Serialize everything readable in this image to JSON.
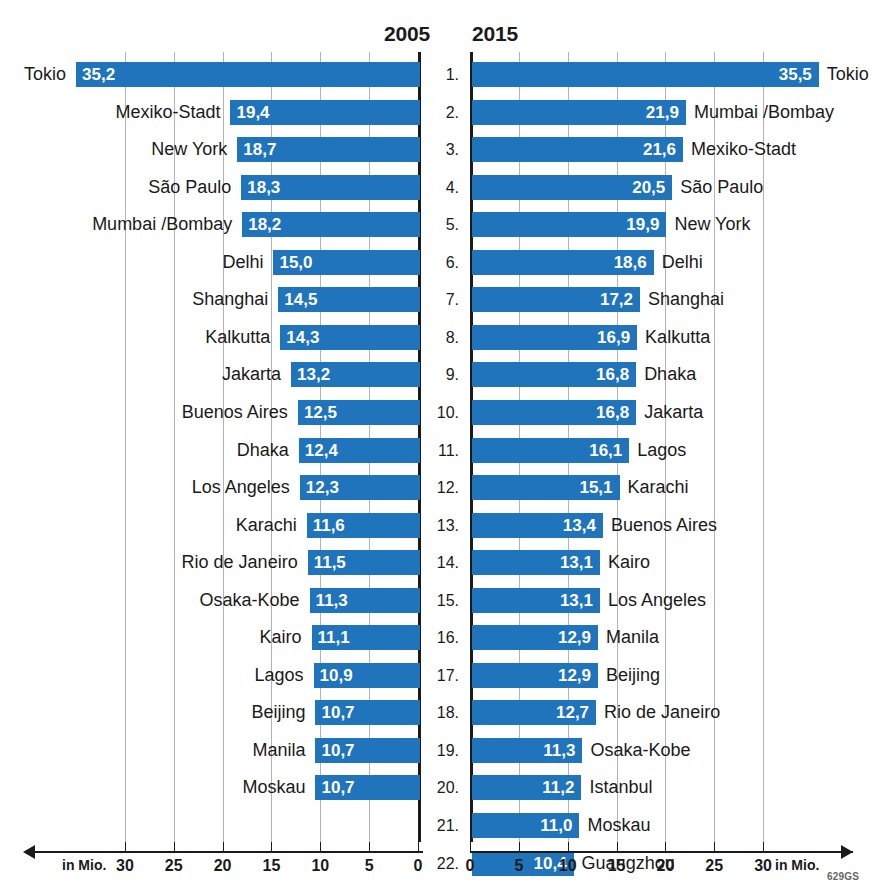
{
  "chart_data": {
    "type": "bar",
    "title": "",
    "xlabel": "in Mio.",
    "ylabel": "",
    "orientation": "horizontal",
    "grid": true,
    "panels": [
      {
        "name": "2005",
        "year_label": "2005",
        "direction": "rtl",
        "axis_unit": "in Mio.",
        "xlim": [
          0,
          35.2
        ],
        "ticks": [
          30,
          25,
          20,
          15,
          10,
          5,
          0
        ],
        "tick_labels": [
          "30",
          "25",
          "20",
          "15",
          "10",
          "5",
          "0"
        ],
        "categories": [
          "Tokio",
          "Mexiko-Stadt",
          "New York",
          "São Paulo",
          "Mumbai /Bombay",
          "Delhi",
          "Shanghai",
          "Kalkutta",
          "Jakarta",
          "Buenos Aires",
          "Dhaka",
          "Los Angeles",
          "Karachi",
          "Rio de Janeiro",
          "Osaka-Kobe",
          "Kairo",
          "Lagos",
          "Beijing",
          "Manila",
          "Moskau"
        ],
        "values": [
          35.2,
          19.4,
          18.7,
          18.3,
          18.2,
          15.0,
          14.5,
          14.3,
          13.2,
          12.5,
          12.4,
          12.3,
          11.6,
          11.5,
          11.3,
          11.1,
          10.9,
          10.7,
          10.7,
          10.7
        ],
        "value_labels": [
          "35,2",
          "19,4",
          "18,7",
          "18,3",
          "18,2",
          "15,0",
          "14,5",
          "14,3",
          "13,2",
          "12,5",
          "12,4",
          "12,3",
          "11,6",
          "11,5",
          "11,3",
          "11,1",
          "10,9",
          "10,7",
          "10,7",
          "10,7"
        ]
      },
      {
        "name": "2015",
        "year_label": "2015",
        "direction": "ltr",
        "axis_unit": "in Mio.",
        "xlim": [
          0,
          35.5
        ],
        "ticks": [
          0,
          5,
          10,
          15,
          20,
          25,
          30
        ],
        "tick_labels": [
          "0",
          "5",
          "10",
          "15",
          "20",
          "25",
          "30"
        ],
        "categories": [
          "Tokio",
          "Mumbai /Bombay",
          "Mexiko-Stadt",
          "São Paulo",
          "New York",
          "Delhi",
          "Shanghai",
          "Kalkutta",
          "Dhaka",
          "Jakarta",
          "Lagos",
          "Karachi",
          "Buenos Aires",
          "Kairo",
          "Los Angeles",
          "Manila",
          "Beijing",
          "Rio de Janeiro",
          "Osaka-Kobe",
          "Istanbul",
          "Moskau",
          "Guangzhou"
        ],
        "values": [
          35.5,
          21.9,
          21.6,
          20.5,
          19.9,
          18.6,
          17.2,
          16.9,
          16.8,
          16.8,
          16.1,
          15.1,
          13.4,
          13.1,
          13.1,
          12.9,
          12.9,
          12.7,
          11.3,
          11.2,
          11.0,
          10.4
        ],
        "value_labels": [
          "35,5",
          "21,9",
          "21,6",
          "20,5",
          "19,9",
          "18,6",
          "17,2",
          "16,9",
          "16,8",
          "16,8",
          "16,1",
          "15,1",
          "13,4",
          "13,1",
          "13,1",
          "12,9",
          "12,9",
          "12,7",
          "11,3",
          "11,2",
          "11,0",
          "10,4"
        ]
      }
    ],
    "ranks": [
      "1.",
      "2.",
      "3.",
      "4.",
      "5.",
      "6.",
      "7.",
      "8.",
      "9.",
      "10.",
      "11.",
      "12.",
      "13.",
      "14.",
      "15.",
      "16.",
      "17.",
      "18.",
      "19.",
      "20.",
      "21.",
      "22."
    ],
    "colors": {
      "bar": "#1f74bb",
      "bar_text": "#ffffff",
      "axis": "#1a1a1a",
      "gridline": "#b3b3b3",
      "label_text": "#1a1a1a",
      "background": "#ffffff"
    }
  },
  "source_code": "629GS"
}
